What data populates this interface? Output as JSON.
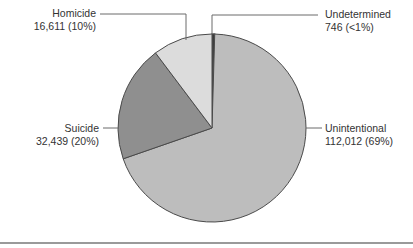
{
  "chart_data": {
    "type": "pie",
    "title": "",
    "start_angle_deg": 0,
    "direction": "clockwise",
    "total": 161808,
    "slices": [
      {
        "name": "Undetermined",
        "value": 746,
        "percent_label": "<1%",
        "color": "#3a3a3a"
      },
      {
        "name": "Unintentional",
        "value": 112012,
        "percent_label": "69%",
        "color": "#bdbdbd"
      },
      {
        "name": "Suicide",
        "value": 32439,
        "percent_label": "20%",
        "color": "#8f8f8f"
      },
      {
        "name": "Homicide",
        "value": 16611,
        "percent_label": "10%",
        "color": "#dcdcdc"
      }
    ],
    "legend": "direct labels with leader lines",
    "grid": false
  },
  "labels": {
    "homicide": {
      "name": "Homicide",
      "detail": "16,611 (10%)"
    },
    "suicide": {
      "name": "Suicide",
      "detail": "32,439 (20%)"
    },
    "undetermined": {
      "name": "Undetermined",
      "detail": "746 (<1%)"
    },
    "unintentional": {
      "name": "Unintentional",
      "detail": "112,012 (69%)"
    }
  },
  "colors": {
    "outline": "#4a4a4a",
    "leader": "#6a6a6a",
    "divider": "#9a9a9a"
  }
}
